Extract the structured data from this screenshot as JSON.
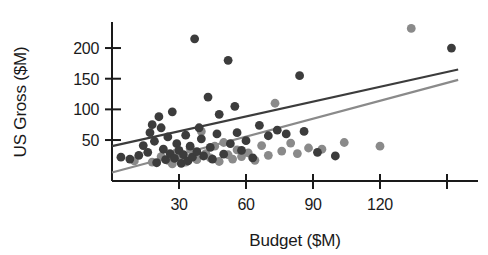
{
  "chart_data": {
    "type": "scatter",
    "title": "",
    "xlabel": "Budget ($M)",
    "ylabel": "US Gross ($M)",
    "xlim": [
      0,
      157
    ],
    "ylim": [
      0,
      245
    ],
    "grid": false,
    "legend": "none",
    "xticks": [
      30,
      60,
      90,
      120,
      150
    ],
    "xtick_labels": [
      "30",
      "60",
      "90",
      "120",
      ""
    ],
    "yticks": [
      50,
      100,
      150,
      200
    ],
    "ytick_labels": [
      "50",
      "100",
      "150",
      "200"
    ],
    "series": [
      {
        "name": "dark-series",
        "color": "#3c3c3c",
        "marker": "circle",
        "points": [
          [
            4,
            22
          ],
          [
            8,
            19
          ],
          [
            12,
            25
          ],
          [
            14,
            41
          ],
          [
            16,
            30
          ],
          [
            17,
            62
          ],
          [
            18,
            75
          ],
          [
            19,
            48
          ],
          [
            20,
            13
          ],
          [
            21,
            88
          ],
          [
            22,
            70
          ],
          [
            23,
            35
          ],
          [
            24,
            18
          ],
          [
            25,
            55
          ],
          [
            26,
            28
          ],
          [
            27,
            96
          ],
          [
            28,
            20
          ],
          [
            29,
            44
          ],
          [
            30,
            33
          ],
          [
            31,
            12
          ],
          [
            32,
            26
          ],
          [
            33,
            58
          ],
          [
            34,
            16
          ],
          [
            35,
            40
          ],
          [
            36,
            22
          ],
          [
            37,
            215
          ],
          [
            38,
            31
          ],
          [
            39,
            70
          ],
          [
            40,
            52
          ],
          [
            41,
            24
          ],
          [
            43,
            120
          ],
          [
            44,
            38
          ],
          [
            45,
            19
          ],
          [
            47,
            60
          ],
          [
            48,
            92
          ],
          [
            50,
            27
          ],
          [
            52,
            180
          ],
          [
            53,
            44
          ],
          [
            55,
            105
          ],
          [
            56,
            62
          ],
          [
            58,
            33
          ],
          [
            60,
            49
          ],
          [
            63,
            21
          ],
          [
            66,
            74
          ],
          [
            70,
            57
          ],
          [
            74,
            66
          ],
          [
            78,
            60
          ],
          [
            84,
            155
          ],
          [
            86,
            64
          ],
          [
            92,
            30
          ],
          [
            100,
            24
          ],
          [
            152,
            200
          ]
        ]
      },
      {
        "name": "light-series",
        "color": "#8a8a8a",
        "marker": "circle",
        "points": [
          [
            10,
            16
          ],
          [
            18,
            14
          ],
          [
            22,
            23
          ],
          [
            25,
            17
          ],
          [
            27,
            11
          ],
          [
            29,
            30
          ],
          [
            31,
            20
          ],
          [
            33,
            14
          ],
          [
            35,
            36
          ],
          [
            36,
            25
          ],
          [
            38,
            18
          ],
          [
            40,
            64
          ],
          [
            42,
            28
          ],
          [
            44,
            21
          ],
          [
            46,
            40
          ],
          [
            48,
            15
          ],
          [
            50,
            46
          ],
          [
            52,
            26
          ],
          [
            54,
            19
          ],
          [
            56,
            34
          ],
          [
            58,
            23
          ],
          [
            61,
            29
          ],
          [
            64,
            17
          ],
          [
            67,
            41
          ],
          [
            70,
            25
          ],
          [
            73,
            110
          ],
          [
            76,
            32
          ],
          [
            80,
            45
          ],
          [
            83,
            28
          ],
          [
            88,
            37
          ],
          [
            94,
            35
          ],
          [
            104,
            46
          ],
          [
            120,
            40
          ],
          [
            134,
            232
          ]
        ]
      }
    ],
    "trendlines": [
      {
        "name": "dark-trendline",
        "color": "#3c3c3c",
        "x_start": 0,
        "y_start": 40,
        "x_end": 155,
        "y_end": 165
      },
      {
        "name": "light-trendline",
        "color": "#8a8a8a",
        "x_start": 0,
        "y_start": -3,
        "x_end": 155,
        "y_end": 148
      }
    ]
  },
  "axes": {
    "x_title": "Budget ($M)",
    "y_title": "US Gross ($M)"
  }
}
